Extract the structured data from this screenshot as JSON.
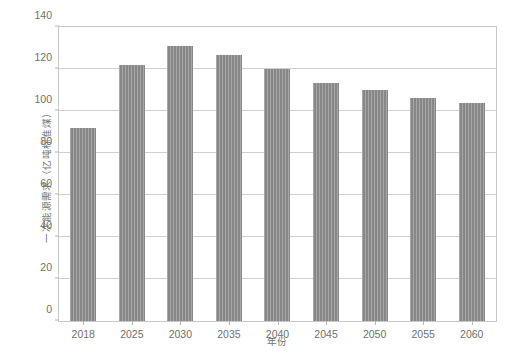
{
  "chart_data": {
    "type": "bar",
    "title": "",
    "xlabel": "年份",
    "ylabel": "一次能源需求（亿吨标准煤）",
    "categories": [
      "2018",
      "2025",
      "2030",
      "2035",
      "2040",
      "2045",
      "2050",
      "2055",
      "2060"
    ],
    "values": [
      92,
      122,
      131,
      126.5,
      120,
      113.5,
      110,
      106,
      104
    ],
    "series": [
      {
        "name": "一次能源需求",
        "values": [
          92,
          122,
          131,
          126.5,
          120,
          113.5,
          110,
          106,
          104
        ]
      }
    ],
    "ylim": [
      0,
      140
    ],
    "yticks": [
      0,
      20,
      40,
      60,
      80,
      100,
      120,
      140
    ],
    "ytick_labels": [
      "0",
      "20",
      "40",
      "60",
      "80",
      "100",
      "120",
      "140"
    ],
    "xlim_categories": 9,
    "grid": "horizontal",
    "legend": "none",
    "bar_color": "#8e8e8e",
    "grid_color": "#cfcfcf",
    "frame_color": "#c8c8c8",
    "text_color": "#6f6f6f"
  },
  "caption": ""
}
